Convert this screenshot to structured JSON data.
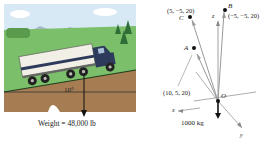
{
  "truck_figure": {
    "angle_label": "10°",
    "weight_label": "Weight = 48,000 lb"
  },
  "vector_figure": {
    "points": [
      {
        "name": "C",
        "coords": "(5, −5, 20)"
      },
      {
        "name": "B",
        "coords": "(−5, −5, 20)"
      },
      {
        "name": "A",
        "coords": "(10, 5, 20)"
      },
      {
        "name": "O",
        "coords": ""
      }
    ],
    "axes": {
      "x": "x",
      "y": "y",
      "z": "z"
    },
    "mass_label": "1000 kg"
  },
  "colors": {
    "sky": "#d6e9f5",
    "grass": "#7cbf6a",
    "soil": "#a67c52",
    "truck_cab": "#2e3a5c",
    "trailer": "#f2efe6",
    "vector_gray": "#888888"
  }
}
